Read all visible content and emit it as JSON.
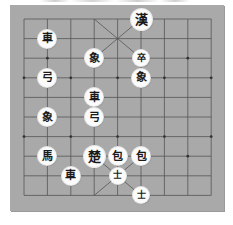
{
  "board": {
    "columns": 9,
    "rows": 10,
    "grid_origin": [
      24,
      19
    ],
    "cell_w": 23.4,
    "cell_h": 19.6,
    "colors": {
      "board": "#a9a9a9",
      "line": "#555555",
      "piece_bg": "#fbfbfb",
      "piece_text": "#1a1a1a"
    },
    "palaces": [
      {
        "name": "top-palace",
        "col_from": 3,
        "col_to": 5,
        "row_from": 0,
        "row_to": 2
      },
      {
        "name": "bottom-palace",
        "col_from": 3,
        "col_to": 5,
        "row_from": 7,
        "row_to": 9
      }
    ],
    "markers": [
      [
        1,
        2
      ],
      [
        7,
        2
      ],
      [
        0,
        3
      ],
      [
        2,
        3
      ],
      [
        4,
        3
      ],
      [
        6,
        3
      ],
      [
        8,
        3
      ],
      [
        0,
        6
      ],
      [
        2,
        6
      ],
      [
        4,
        6
      ],
      [
        6,
        6
      ],
      [
        8,
        6
      ],
      [
        1,
        7
      ],
      [
        7,
        7
      ]
    ]
  },
  "pieces": [
    {
      "id": "han-general",
      "label": "漢",
      "col": 5,
      "row": 0,
      "size": "big"
    },
    {
      "id": "chariot-1",
      "label": "車",
      "col": 1,
      "row": 1,
      "size": "normal"
    },
    {
      "id": "elephant-1",
      "label": "象",
      "col": 3,
      "row": 2,
      "size": "normal"
    },
    {
      "id": "soldier-1",
      "label": "卒",
      "col": 5,
      "row": 2,
      "size": "small"
    },
    {
      "id": "cannon-1",
      "label": "弓",
      "col": 1,
      "row": 3,
      "size": "normal"
    },
    {
      "id": "elephant-2",
      "label": "象",
      "col": 5,
      "row": 3,
      "size": "normal"
    },
    {
      "id": "chariot-2",
      "label": "車",
      "col": 3,
      "row": 4,
      "size": "normal"
    },
    {
      "id": "elephant-3",
      "label": "象",
      "col": 1,
      "row": 5,
      "size": "normal"
    },
    {
      "id": "cannon-2",
      "label": "弓",
      "col": 3,
      "row": 5,
      "size": "normal"
    },
    {
      "id": "horse-1",
      "label": "馬",
      "col": 1,
      "row": 7,
      "size": "normal"
    },
    {
      "id": "cho-general",
      "label": "楚",
      "col": 3,
      "row": 7,
      "size": "big"
    },
    {
      "id": "cannon-3",
      "label": "包",
      "col": 4,
      "row": 7,
      "size": "normal"
    },
    {
      "id": "cannon-4",
      "label": "包",
      "col": 5,
      "row": 7,
      "size": "normal"
    },
    {
      "id": "chariot-3",
      "label": "車",
      "col": 2,
      "row": 8,
      "size": "normal"
    },
    {
      "id": "advisor-1",
      "label": "士",
      "col": 4,
      "row": 8,
      "size": "small"
    },
    {
      "id": "advisor-2",
      "label": "士",
      "col": 5,
      "row": 9,
      "size": "small"
    }
  ]
}
